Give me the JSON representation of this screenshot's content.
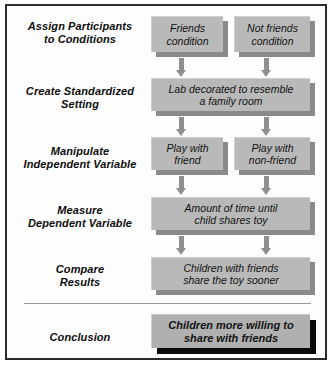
{
  "diagram": {
    "colors": {
      "frame_border": "#2b2b2b",
      "box_fill": "#b9b9b9",
      "box_shadow": "#8a8a8a",
      "conclusion_shadow": "#0a0a0a",
      "arrow": "#8f8f8f",
      "background": "#ffffff",
      "text": "#0d0d0d"
    },
    "rows": [
      {
        "label": "Assign Participants\nto Conditions",
        "label_line1": "Assign Participants",
        "label_line2": "to Conditions",
        "boxes": [
          {
            "line1": "Friends",
            "line2": "condition"
          },
          {
            "line1": "Not friends",
            "line2": "condition"
          }
        ]
      },
      {
        "label": "Create Standardized\nSetting",
        "label_line1": "Create Standardized",
        "label_line2": "Setting",
        "boxes": [
          {
            "line1": "Lab decorated to resemble",
            "line2": "a family room"
          }
        ]
      },
      {
        "label": "Manipulate\nIndependent Variable",
        "label_line1": "Manipulate",
        "label_line2": "Independent Variable",
        "boxes": [
          {
            "line1": "Play with",
            "line2": "friend"
          },
          {
            "line1": "Play with",
            "line2": "non-friend"
          }
        ]
      },
      {
        "label": "Measure\nDependent Variable",
        "label_line1": "Measure",
        "label_line2": "Dependent Variable",
        "boxes": [
          {
            "line1": "Amount of time until",
            "line2": "child shares toy"
          }
        ]
      },
      {
        "label": "Compare\nResults",
        "label_line1": "Compare",
        "label_line2": "Results",
        "boxes": [
          {
            "line1": "Children with friends",
            "line2": "share the toy sooner"
          }
        ]
      },
      {
        "label": "Conclusion",
        "label_line1": "Conclusion",
        "label_line2": "",
        "boxes": [
          {
            "line1": "Children more willing to",
            "line2": "share with friends"
          }
        ]
      }
    ]
  }
}
